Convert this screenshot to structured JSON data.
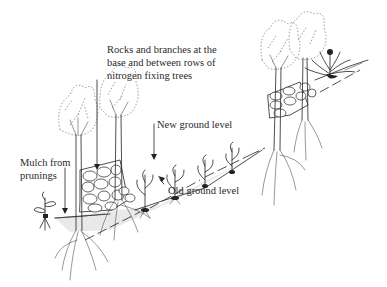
{
  "figure": {
    "labels": {
      "rocks": [
        "Rocks and branches at the",
        "base and between rows of",
        "nitrogen fixing trees"
      ],
      "new_ground": "New ground level",
      "mulch": [
        "Mulch from",
        "prunings"
      ],
      "old_ground": "Old ground level"
    },
    "elements": [
      "nitrogen-fixing-tree",
      "rock-wall",
      "crop-plant",
      "seedling",
      "mulch-layer",
      "old-ground-line",
      "new-ground-line",
      "annotation-arrow"
    ],
    "colors": {
      "ink": "#222222",
      "text": "#2a2a2a",
      "background": "#ffffff",
      "mulch": "#e9e9e9"
    }
  }
}
